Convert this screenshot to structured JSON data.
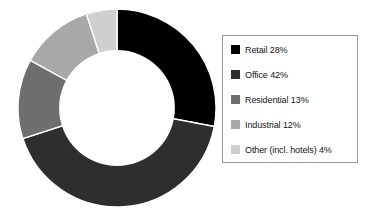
{
  "chart_data": {
    "type": "pie",
    "variant": "donut",
    "title": "",
    "subtitle": "",
    "xlabel": "",
    "ylabel": "",
    "unit": "%",
    "grid": false,
    "legend_position": "right",
    "start_angle_deg": 0,
    "direction": "clockwise",
    "inner_radius_ratio": 0.585,
    "categories": [
      "Retail",
      "Office",
      "Residential",
      "Industrial",
      "Other (incl. hotels)"
    ],
    "values": [
      28,
      42,
      13,
      12,
      4
    ],
    "colors": [
      "#000000",
      "#2e2e2e",
      "#6e6e6e",
      "#a8a8a8",
      "#cfcfcf"
    ],
    "slices": [
      {
        "label": "Retail",
        "value": 28,
        "display": "Retail 28%",
        "color": "#000000",
        "start_deg": 0,
        "end_deg": 100.8
      },
      {
        "label": "Office",
        "value": 42,
        "display": "Office 42%",
        "color": "#2e2e2e",
        "start_deg": 100.8,
        "end_deg": 252.0
      },
      {
        "label": "Residential",
        "value": 13,
        "display": "Residential 13%",
        "color": "#6e6e6e",
        "start_deg": 252.0,
        "end_deg": 298.8
      },
      {
        "label": "Industrial",
        "value": 12,
        "display": "Industrial 12%",
        "color": "#a8a8a8",
        "start_deg": 298.8,
        "end_deg": 342.0
      },
      {
        "label": "Other (incl. hotels)",
        "value": 4,
        "display": "Other (incl. hotels) 4%",
        "color": "#cfcfcf",
        "start_deg": 342.0,
        "end_deg": 360.0
      }
    ]
  },
  "legend": {
    "border_color": "#9a9a9a",
    "items": [
      {
        "label": "Retail 28%",
        "color": "#000000"
      },
      {
        "label": "Office 42%",
        "color": "#2e2e2e"
      },
      {
        "label": "Residential 13%",
        "color": "#6e6e6e"
      },
      {
        "label": "Industrial 12%",
        "color": "#a8a8a8"
      },
      {
        "label": "Other (incl. hotels) 4%",
        "color": "#cfcfcf"
      }
    ]
  },
  "canvas": {
    "background": "#ffffff",
    "hole_color": "#ffffff",
    "separator_color": "#ffffff"
  }
}
